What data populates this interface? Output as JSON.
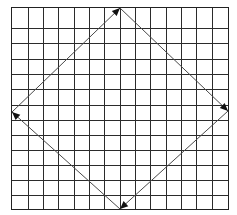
{
  "diagram": {
    "type": "grid-with-diamond-arrows",
    "grid": {
      "columns": 14,
      "rows": 13,
      "col_lines_x": [
        11,
        28,
        43,
        58,
        74,
        89,
        104,
        120,
        135,
        150,
        166,
        181,
        196,
        212,
        228
      ],
      "row_lines_y": [
        7,
        28,
        43,
        59,
        74,
        89,
        105,
        120,
        135,
        150,
        165,
        180,
        195,
        209
      ],
      "line_color": "#2b2b2b"
    },
    "diamond": {
      "vertices": {
        "top": [
          120,
          8
        ],
        "right": [
          228,
          111
        ],
        "bottom": [
          120,
          209
        ],
        "left": [
          12,
          112
        ]
      },
      "edges": [
        {
          "from": "left",
          "to": "top",
          "arrow_at": "top"
        },
        {
          "from": "top",
          "to": "right",
          "arrow_at": "right"
        },
        {
          "from": "right",
          "to": "bottom",
          "arrow_at": "bottom"
        },
        {
          "from": "bottom",
          "to": "left",
          "arrow_at": "left"
        }
      ],
      "edge_color": "#4a4a4a",
      "arrow_color": "#111111"
    }
  }
}
